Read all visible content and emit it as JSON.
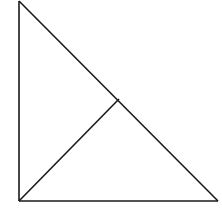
{
  "diagram": {
    "type": "geometry",
    "stroke_color": "#1a1a1a",
    "background": "#ffffff",
    "vertices": {
      "top": [
        19,
        1
      ],
      "bottom_left_right_angle": [
        19,
        201
      ],
      "bottom_right": [
        218,
        201
      ],
      "altitude_foot": [
        119,
        99
      ]
    },
    "segments": [
      {
        "name": "left-leg",
        "from": "top",
        "to": "bottom_left_right_angle"
      },
      {
        "name": "bottom-leg",
        "from": "bottom_left_right_angle",
        "to": "bottom_right"
      },
      {
        "name": "hypotenuse",
        "from": "top",
        "to": "bottom_right"
      },
      {
        "name": "altitude",
        "from": "bottom_left_right_angle",
        "to": "altitude_foot"
      }
    ]
  }
}
